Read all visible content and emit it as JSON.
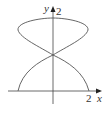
{
  "diagram": {
    "type": "parametric-curve-plot",
    "axes": {
      "x_label": "x",
      "y_label": "y",
      "x_tick_label": "2",
      "y_tick_label": "2"
    },
    "curve": {
      "description": "hourglass-shaped closed curve with upper loop and lower arc, self-intersecting on the y-axis at y=1",
      "color": "#555555",
      "key_points": [
        {
          "x": 0,
          "y": 2
        },
        {
          "x": 0,
          "y": 1
        },
        {
          "x": -2,
          "y": 0
        },
        {
          "x": 2,
          "y": 0
        }
      ]
    },
    "axis_color": "#333333"
  }
}
